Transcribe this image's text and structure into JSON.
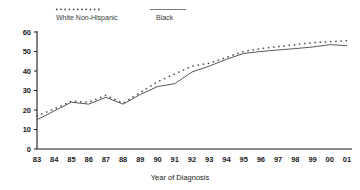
{
  "chart_data": {
    "type": "line",
    "title": "",
    "subtitle": "",
    "xlabel": "Year of Diagnosis",
    "ylabel": "",
    "xlim": [
      1983,
      2001
    ],
    "ylim": [
      0,
      60
    ],
    "grid": false,
    "legend_position": "top",
    "categories": [
      "83",
      "84",
      "85",
      "86",
      "87",
      "88",
      "89",
      "90",
      "91",
      "92",
      "93",
      "94",
      "95",
      "96",
      "97",
      "98",
      "99",
      "00",
      "01"
    ],
    "x": [
      1983,
      1984,
      1985,
      1986,
      1987,
      1988,
      1989,
      1990,
      1991,
      1992,
      1993,
      1994,
      1995,
      1996,
      1997,
      1998,
      1999,
      2000,
      2001
    ],
    "xtick_labels": [
      "83",
      "84",
      "85",
      "86",
      "87",
      "88",
      "89",
      "90",
      "91",
      "92",
      "93",
      "94",
      "95",
      "96",
      "97",
      "98",
      "99",
      "00",
      "01"
    ],
    "ytick_labels": [
      "0",
      "10",
      "20",
      "30",
      "40",
      "50",
      "60"
    ],
    "yticks": [
      0,
      10,
      20,
      30,
      40,
      50,
      60
    ],
    "series": [
      {
        "name": "White Non-Hispanic",
        "style": "dotted",
        "color": "#4a4a4a",
        "values": [
          17.0,
          20.5,
          24.5,
          24.0,
          27.5,
          23.5,
          29.0,
          34.5,
          38.5,
          42.5,
          44.0,
          47.0,
          50.0,
          51.5,
          52.5,
          53.5,
          54.5,
          55.0,
          55.5
        ]
      },
      {
        "name": "Black",
        "style": "solid",
        "color": "#444444",
        "values": [
          15.0,
          19.5,
          24.0,
          23.0,
          26.5,
          23.0,
          28.0,
          32.0,
          33.5,
          39.5,
          42.5,
          46.0,
          49.0,
          50.0,
          50.8,
          51.5,
          52.3,
          53.5,
          53.0
        ]
      }
    ]
  },
  "legend": {
    "items": [
      {
        "label": "White Non-Hispanic",
        "marker": "dotted-line-marker"
      },
      {
        "label": "Black",
        "marker": "solid-line-marker"
      }
    ]
  },
  "axis": {
    "x_title": "Year of Diagnosis"
  }
}
